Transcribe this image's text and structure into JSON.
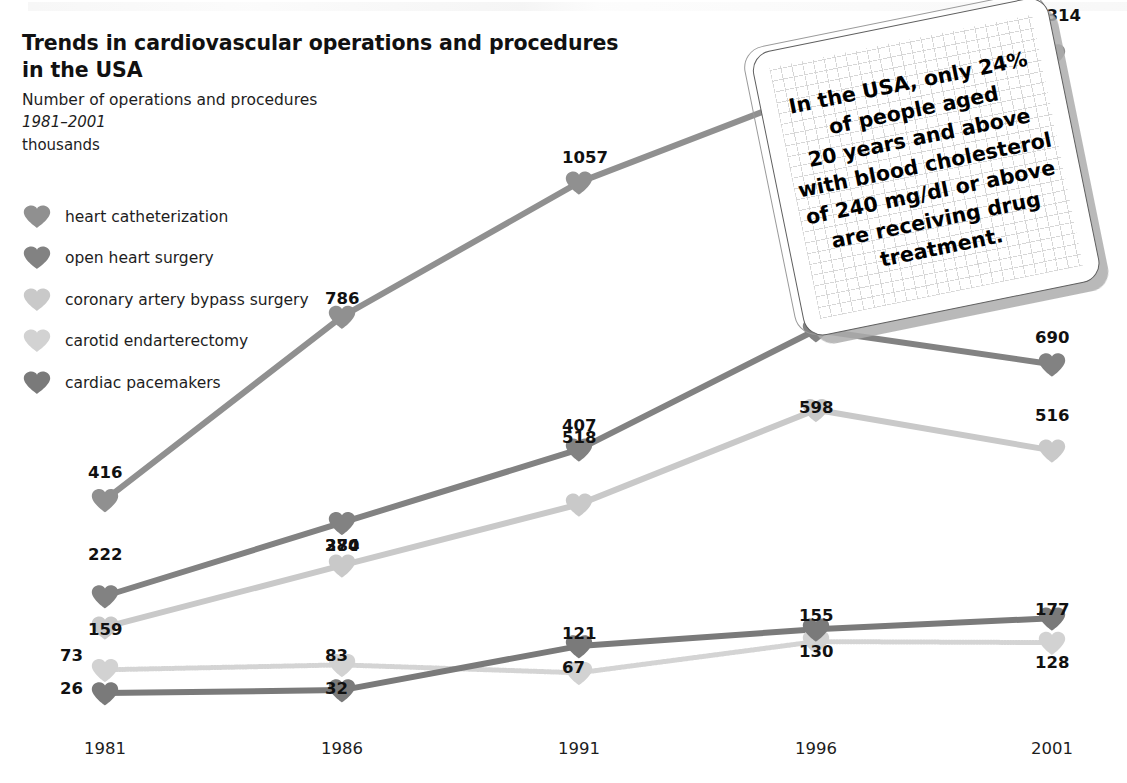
{
  "title": {
    "main_line1": "Trends in cardiovascular operations and procedures",
    "main_line2": "in the USA",
    "subtitle": "Number of operations and procedures",
    "period": "1981–2001",
    "units": "thousands"
  },
  "legend": {
    "items": [
      {
        "label": "heart catheterization",
        "icon": "heart-icon",
        "color": "#909090"
      },
      {
        "label": "open heart surgery",
        "icon": "heart-icon",
        "color": "#828282"
      },
      {
        "label": "coronary artery bypass surgery",
        "icon": "heart-icon",
        "color": "#c9c9c9"
      },
      {
        "label": "carotid endarterectomy",
        "icon": "heart-icon",
        "color": "#d2d2d2"
      },
      {
        "label": "cardiac pacemakers",
        "icon": "heart-icon",
        "color": "#7a7a7a"
      }
    ]
  },
  "callout": {
    "lines": [
      "In the USA, only 24%",
      "of people aged",
      "20 years and above",
      "with blood cholesterol",
      "of 240 mg/dl or above",
      "are receiving drug",
      "treatment."
    ]
  },
  "chart_data": {
    "type": "line",
    "title": "Trends in cardiovascular operations and procedures in the USA",
    "subtitle": "Number of operations and procedures 1981–2001",
    "xlabel": "",
    "ylabel": "thousands",
    "categories": [
      "1981",
      "1986",
      "1991",
      "1996",
      "2001"
    ],
    "x": [
      1981,
      1986,
      1991,
      1996,
      2001
    ],
    "ylim": [
      0,
      1400
    ],
    "grid": false,
    "legend_position": "top-left",
    "marker": "heart",
    "series": [
      {
        "name": "heart catheterization",
        "color": "#909090",
        "values": [
          416,
          786,
          1057,
          1241,
          1314
        ]
      },
      {
        "name": "open heart surgery",
        "color": "#828282",
        "values": [
          222,
          370,
          518,
          759,
          690
        ]
      },
      {
        "name": "coronary artery bypass surgery",
        "color": "#c9c9c9",
        "values": [
          159,
          284,
          407,
          598,
          516
        ]
      },
      {
        "name": "carotid endarterectomy",
        "color": "#d2d2d2",
        "values": [
          73,
          83,
          67,
          130,
          128
        ]
      },
      {
        "name": "cardiac pacemakers",
        "color": "#7a7a7a",
        "values": [
          26,
          32,
          121,
          155,
          177
        ]
      }
    ]
  }
}
